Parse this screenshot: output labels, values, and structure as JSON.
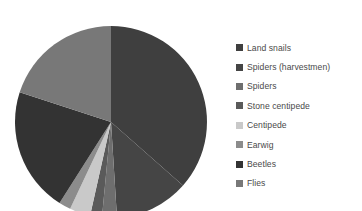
{
  "chart_data": {
    "type": "pie",
    "title": "",
    "xlabel": "",
    "ylabel": "",
    "legend_position": "right",
    "grid": false,
    "start_angle_deg": 0,
    "direction": "clockwise",
    "categories": [
      "Land snails",
      "Spiders (harvestmen)",
      "Spiders",
      "Stone centipede",
      "Centipede",
      "Earwig",
      "Beetles",
      "Flies"
    ],
    "values": [
      36.5,
      12.5,
      2.5,
      2.0,
      3.5,
      2.0,
      21.0,
      20.0
    ],
    "colors": [
      "#3f3f3f",
      "#454545",
      "#6e6e6e",
      "#5a5a5a",
      "#c9c9c9",
      "#8c8c8c",
      "#333333",
      "#787878"
    ],
    "slices": [
      {
        "label": "Land snails",
        "value": 36.5,
        "color": "#3f3f3f",
        "start_deg": 0.0,
        "end_deg": 131.4
      },
      {
        "label": "Spiders (harvestmen)",
        "value": 12.5,
        "color": "#454545",
        "start_deg": 131.4,
        "end_deg": 176.4
      },
      {
        "label": "Spiders",
        "value": 2.5,
        "color": "#6e6e6e",
        "start_deg": 176.4,
        "end_deg": 185.4
      },
      {
        "label": "Stone centipede",
        "value": 2.0,
        "color": "#5a5a5a",
        "start_deg": 185.4,
        "end_deg": 192.6
      },
      {
        "label": "Centipede",
        "value": 3.5,
        "color": "#c9c9c9",
        "start_deg": 192.6,
        "end_deg": 205.2
      },
      {
        "label": "Earwig",
        "value": 2.0,
        "color": "#8c8c8c",
        "start_deg": 205.2,
        "end_deg": 212.4
      },
      {
        "label": "Beetles",
        "value": 21.0,
        "color": "#333333",
        "start_deg": 212.4,
        "end_deg": 288.0
      },
      {
        "label": "Flies",
        "value": 20.0,
        "color": "#787878",
        "start_deg": 288.0,
        "end_deg": 360.0
      }
    ]
  },
  "legend": {
    "items": [
      {
        "label": "Land snails",
        "color": "#3f3f3f"
      },
      {
        "label": "Spiders (harvestmen)",
        "color": "#454545"
      },
      {
        "label": "Spiders",
        "color": "#6e6e6e"
      },
      {
        "label": "Stone centipede",
        "color": "#5a5a5a"
      },
      {
        "label": "Centipede",
        "color": "#c9c9c9"
      },
      {
        "label": "Earwig",
        "color": "#8c8c8c"
      },
      {
        "label": "Beetles",
        "color": "#333333"
      },
      {
        "label": "Flies",
        "color": "#787878"
      }
    ]
  },
  "canvas": {
    "background": "#ffffff",
    "pie_center_x": 111,
    "pie_center_y": 122,
    "pie_radius": 96
  }
}
